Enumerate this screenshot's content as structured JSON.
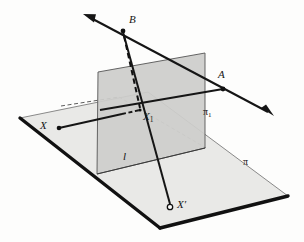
{
  "figure": {
    "type": "geometry-diagram",
    "background_color": "#fdfdfc",
    "ink_color": "#151515"
  },
  "labels": {
    "point_b": "B",
    "point_a": "A",
    "point_x": "X",
    "point_x1_base": "X",
    "point_x1_sub": "1",
    "point_x_prime": "X′",
    "line_l": "l",
    "plane_pi": "π",
    "plane_pi1_base": "π",
    "plane_pi1_sub": "1"
  },
  "planes": [
    {
      "name": "pi",
      "label": "π",
      "orientation": "horizontal",
      "fill": "#e8e8e6",
      "stroke": "#3a3a3a",
      "vertices": [
        [
          20,
          118
        ],
        [
          148,
          92
        ],
        [
          288,
          196
        ],
        [
          160,
          228
        ]
      ],
      "thick_edges": [
        [
          [
            20,
            118
          ],
          [
            160,
            228
          ]
        ],
        [
          [
            160,
            228
          ],
          [
            288,
            196
          ]
        ]
      ]
    },
    {
      "name": "pi1",
      "label": "π₁",
      "orientation": "vertical",
      "fill": "#cfcfcd",
      "stroke": "#3a3a3a",
      "vertices": [
        [
          98,
          72
        ],
        [
          205,
          53
        ],
        [
          205,
          148
        ],
        [
          97,
          174
        ]
      ]
    }
  ],
  "points": [
    {
      "name": "B",
      "x": 123,
      "y": 31,
      "style": "filled",
      "label_x": 130,
      "label_y": 17
    },
    {
      "name": "A",
      "x": 223,
      "y": 89,
      "style": "filled",
      "label_x": 219,
      "label_y": 72
    },
    {
      "name": "X",
      "x": 58,
      "y": 128,
      "style": "filled",
      "label_x": 40,
      "label_y": 120
    },
    {
      "name": "X1",
      "x": 140,
      "y": 110,
      "style": "intersection",
      "label_x": 143,
      "label_y": 112
    },
    {
      "name": "Xprime",
      "x": 170,
      "y": 207,
      "style": "open",
      "label_x": 177,
      "label_y": 199
    }
  ],
  "lines": [
    {
      "name": "ray-through-A-and-B",
      "from": [
        85,
        15
      ],
      "to": [
        272,
        114
      ],
      "style": "solid-thick",
      "arrows": "both"
    },
    {
      "name": "segment-B-to-Xprime",
      "from": [
        123,
        31
      ],
      "to": [
        170,
        207
      ],
      "style": "solid-thick",
      "arrows": "none"
    },
    {
      "name": "segment-X-to-X1",
      "from": [
        58,
        128
      ],
      "to": [
        140,
        110
      ],
      "style": "solid-thick",
      "arrows": "none"
    },
    {
      "name": "segment-B-to-X1-hidden",
      "from": [
        123,
        31
      ],
      "to": [
        140,
        110
      ],
      "style": "dashed",
      "arrows": "none"
    },
    {
      "name": "segment-A-to-X1",
      "from": [
        223,
        89
      ],
      "to": [
        140,
        110
      ],
      "style": "solid-thick",
      "arrows": "none"
    },
    {
      "name": "hidden-plane-edge-left",
      "from": [
        62,
        106
      ],
      "to": [
        118,
        98
      ],
      "style": "dashed-thin",
      "arrows": "none"
    },
    {
      "name": "hidden-plane-edge-right",
      "from": [
        118,
        98
      ],
      "to": [
        205,
        148
      ],
      "style": "dashed-thin",
      "arrows": "none"
    }
  ],
  "label_positions": {
    "plane_pi": {
      "x": 243,
      "y": 157
    },
    "plane_pi1": {
      "x": 203,
      "y": 108
    },
    "line_l": {
      "x": 123,
      "y": 152
    }
  }
}
